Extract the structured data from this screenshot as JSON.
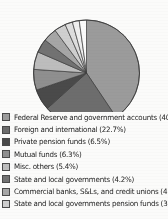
{
  "chart_data": {
    "type": "pie",
    "title": "",
    "unit": "percent",
    "legend_position": "bottom",
    "grid": false,
    "categories": [
      "Federal Reserve and government accounts",
      "Foreign and international",
      "Private pension funds",
      "Mutual funds",
      "Misc. others",
      "State and local governments",
      "Commercial banks, S&Ls, and credit unions",
      "State and local governments pension funds"
    ],
    "values": [
      40.6,
      22.7,
      6.5,
      6.3,
      5.4,
      4.2,
      4.2,
      3.5
    ],
    "slice_colors": [
      "#9b9b9b",
      "#6d6d6d",
      "#4a4a4a",
      "#8f8f8f",
      "#bdbdbd",
      "#727272",
      "#a6a6a6",
      "#cfcfcf"
    ],
    "slices": [
      {
        "label": "Federal Reserve and government accounts",
        "value": 40.6,
        "color": "#9b9b9b"
      },
      {
        "label": "Foreign and international",
        "value": 22.7,
        "color": "#6d6d6d"
      },
      {
        "label": "Private pension funds",
        "value": 6.5,
        "color": "#4a4a4a"
      },
      {
        "label": "Mutual funds",
        "value": 6.3,
        "color": "#8f8f8f"
      },
      {
        "label": "Misc. others",
        "value": 5.4,
        "color": "#bdbdbd"
      },
      {
        "label": "State and local governments",
        "value": 4.2,
        "color": "#727272"
      },
      {
        "label": "Commercial banks, S&Ls, and credit unions",
        "value": 4.2,
        "color": "#a6a6a6"
      },
      {
        "label": "State and local governments pension funds",
        "value": 3.5,
        "color": "#cfcfcf"
      },
      {
        "label": "",
        "value": 2.3,
        "color": "#dedede"
      },
      {
        "label": "",
        "value": 2.1,
        "color": "#efefef"
      },
      {
        "label": "",
        "value": 2.2,
        "color": "#fbfbfb"
      }
    ]
  },
  "legend": {
    "items": [
      {
        "label": "Federal Reserve and government accounts (40.6%)",
        "color": "#9b9b9b"
      },
      {
        "label": "Foreign and international (22.7%)",
        "color": "#6d6d6d"
      },
      {
        "label": "Private pension funds (6.5%)",
        "color": "#4a4a4a"
      },
      {
        "label": "Mutual funds (6.3%)",
        "color": "#8f8f8f"
      },
      {
        "label": "Misc. others (5.4%)",
        "color": "#bdbdbd"
      },
      {
        "label": "State and local governments (4.2%)",
        "color": "#727272"
      },
      {
        "label": "Commercial banks, S&Ls, and credit unions (4.2%)",
        "color": "#a6a6a6"
      },
      {
        "label": "State and local governments pension funds (3.5%)",
        "color": "#cfcfcf"
      }
    ]
  }
}
